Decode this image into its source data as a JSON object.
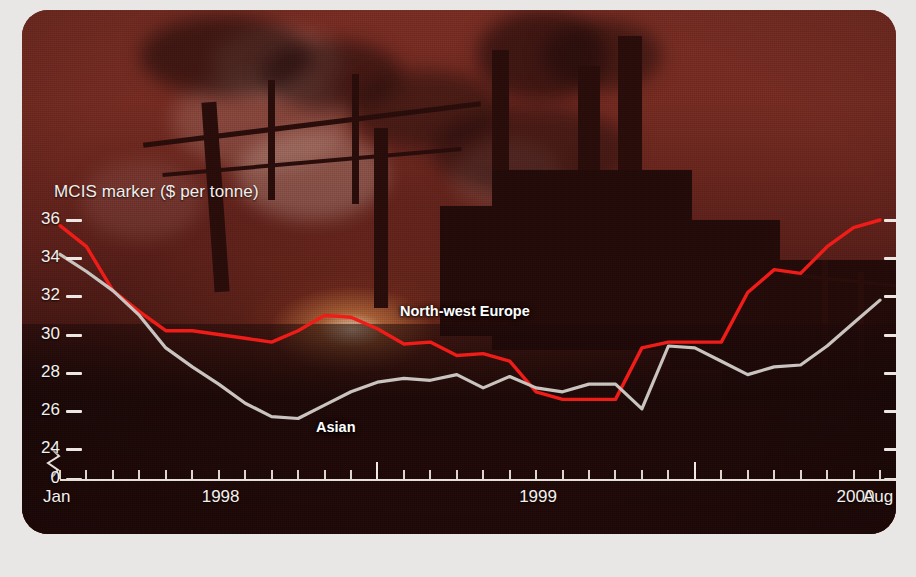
{
  "chart": {
    "axis_title": "MCIS marker ($ per tonne)",
    "y_ticks": [
      36,
      34,
      32,
      30,
      28,
      26,
      24,
      0
    ],
    "x_labels": [
      {
        "text": "Jan",
        "month_index": 0
      },
      {
        "text": "1998",
        "month_index": 6
      },
      {
        "text": "1999",
        "month_index": 18
      },
      {
        "text": "2000",
        "month_index": 30
      },
      {
        "text": "Aug",
        "month_index": 31
      }
    ],
    "series_labels": [
      {
        "name": "North-west Europe",
        "color": "#f01c18"
      },
      {
        "name": "Asian",
        "color": "#c9c4bf"
      }
    ],
    "colors": {
      "nwe_line": "#f01c18",
      "asian_line": "#c9c4bf",
      "axis": "#ece7e2",
      "text": "#f4f0ec",
      "panel_tint": "#5e211c",
      "page_background": "#e9e7e5"
    }
  },
  "chart_data": {
    "type": "line",
    "title": "",
    "subtitle": "",
    "xlabel": "",
    "ylabel": "MCIS marker ($ per tonne)",
    "ylim": [
      24,
      36
    ],
    "y_break": true,
    "y_break_from": 0,
    "y_break_to": 24,
    "yticks": [
      24,
      26,
      28,
      30,
      32,
      34,
      36
    ],
    "grid": false,
    "legend": "inline-annotation",
    "x": [
      "Jan 1998",
      "Feb 1998",
      "Mar 1998",
      "Apr 1998",
      "May 1998",
      "Jun 1998",
      "Jul 1998",
      "Aug 1998",
      "Sep 1998",
      "Oct 1998",
      "Nov 1998",
      "Dec 1998",
      "Jan 1999",
      "Feb 1999",
      "Mar 1999",
      "Apr 1999",
      "May 1999",
      "Jun 1999",
      "Jul 1999",
      "Aug 1999",
      "Sep 1999",
      "Oct 1999",
      "Nov 1999",
      "Dec 1999",
      "Jan 2000",
      "Feb 2000",
      "Mar 2000",
      "Apr 2000",
      "May 2000",
      "Jun 2000",
      "Jul 2000",
      "Aug 2000"
    ],
    "xtick_labels": [
      "Jan",
      "1998",
      "1999",
      "2000",
      "Aug"
    ],
    "series": [
      {
        "name": "North-west Europe",
        "color": "#f01c18",
        "values": [
          35.7,
          34.6,
          32.3,
          31.2,
          30.2,
          30.2,
          30.0,
          29.8,
          29.6,
          30.2,
          31.0,
          30.9,
          30.3,
          29.5,
          29.6,
          28.9,
          29.0,
          28.6,
          27.0,
          26.6,
          26.6,
          26.6,
          29.3,
          29.6,
          29.6,
          29.6,
          32.2,
          33.4,
          33.2,
          34.6,
          35.6,
          36.0
        ]
      },
      {
        "name": "Asian",
        "color": "#c9c4bf",
        "values": [
          34.2,
          33.3,
          32.3,
          31.0,
          29.3,
          28.3,
          27.4,
          26.4,
          25.7,
          25.6,
          26.3,
          27.0,
          27.5,
          27.7,
          27.6,
          27.9,
          27.2,
          27.8,
          27.2,
          27.0,
          27.4,
          27.4,
          26.1,
          29.4,
          29.3,
          28.6,
          27.9,
          28.3,
          28.4,
          29.4,
          30.6,
          31.8
        ]
      }
    ],
    "annotations": [
      {
        "text": "North-west Europe",
        "near_x": "Oct 1998",
        "near_y": 31.0
      },
      {
        "text": "Asian",
        "near_x": "Aug 1998",
        "near_y": 26.0
      }
    ]
  }
}
